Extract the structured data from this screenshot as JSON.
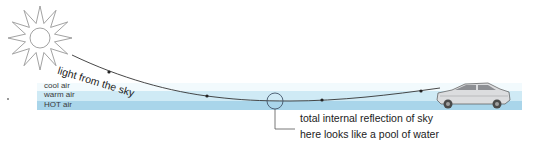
{
  "diagram": {
    "ray_label": "light from the sky",
    "layers": [
      {
        "label": "cool air",
        "color": "#f2fafd"
      },
      {
        "label": "warm air",
        "color": "#cfeaf5"
      },
      {
        "label": "HOT air",
        "color": "#a9d5ea"
      }
    ],
    "callout": {
      "line1": "total internal reflection of sky",
      "line2": "here looks like a pool of water"
    },
    "icons": {
      "sun": "sun-icon",
      "car": "car-icon",
      "focus_circle": "circle-marker-icon"
    },
    "colors": {
      "stroke": "#333333",
      "sun_stroke": "#888888",
      "car_body": "#d9dadb",
      "car_dark": "#555555"
    }
  }
}
